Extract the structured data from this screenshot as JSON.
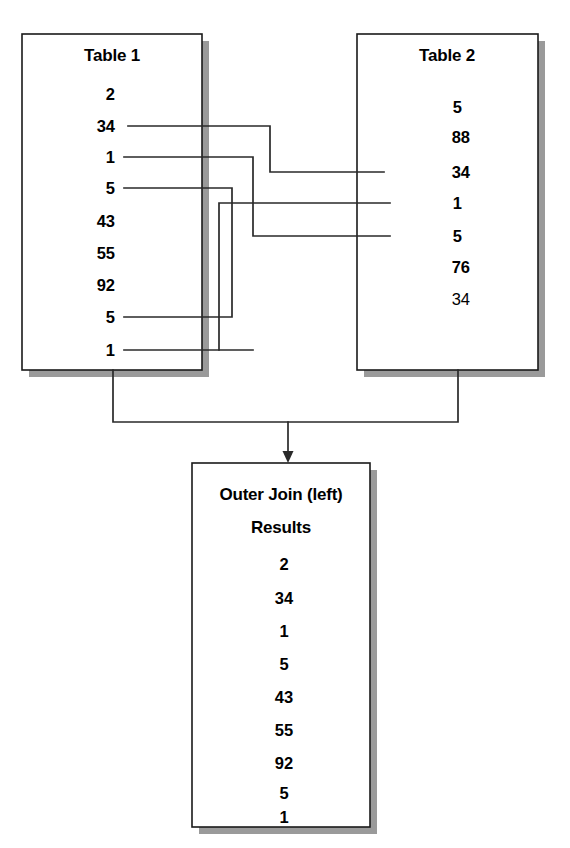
{
  "diagram": {
    "type": "outer-join-illustration",
    "canvas": {
      "width": 570,
      "height": 848,
      "background": "#ffffff"
    },
    "colors": {
      "line": "#2a2a2a",
      "box_border": "#1a1a1a",
      "box_fill": "#ffffff",
      "shadow": "#9a9a9a",
      "text": "#000000"
    }
  },
  "table1": {
    "title": "Table 1",
    "rows": [
      {
        "value": "2",
        "linked": false
      },
      {
        "value": "34",
        "linked": true
      },
      {
        "value": "1",
        "linked": true
      },
      {
        "value": "5",
        "linked": true
      },
      {
        "value": "43",
        "linked": false
      },
      {
        "value": "55",
        "linked": false
      },
      {
        "value": "92",
        "linked": false
      },
      {
        "value": "5",
        "linked": true
      },
      {
        "value": "1",
        "linked": true
      }
    ]
  },
  "table2": {
    "title": "Table 2",
    "rows": [
      {
        "value": "5",
        "linked": false
      },
      {
        "value": "88",
        "linked": false
      },
      {
        "value": "34",
        "linked": true
      },
      {
        "value": "1",
        "linked": true
      },
      {
        "value": "5",
        "linked": true
      },
      {
        "value": "76",
        "linked": false
      },
      {
        "value": "34",
        "linked": false
      }
    ]
  },
  "result": {
    "title_line1": "Outer Join (left)",
    "title_line2": "Results",
    "rows": [
      "2",
      "34",
      "1",
      "5",
      "43",
      "55",
      "92",
      "5",
      "1"
    ]
  },
  "connections": [
    {
      "from": "table1.row.34",
      "to": "table2.row.34"
    },
    {
      "from": "table1.row.1",
      "to": "table2.row.5"
    },
    {
      "from": "table1.row.5",
      "to": "table2.row.5b"
    },
    {
      "from": "table1.row.5b",
      "to": "table2.row.1"
    },
    {
      "from": "table1.row.1b",
      "to": "table2.row.1b"
    }
  ]
}
